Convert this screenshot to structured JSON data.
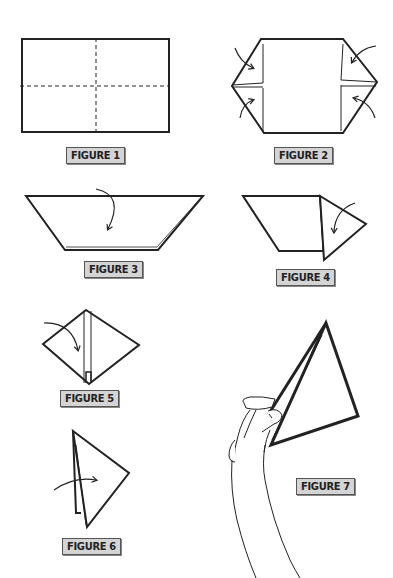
{
  "diagram": {
    "type": "origami-instructions",
    "colors": {
      "line": "#222222",
      "label_bg": "#d4d4d4",
      "label_border": "#555555"
    },
    "figures": [
      {
        "id": 1,
        "label": "FIGURE 1",
        "description": "rectangle with dashed vertical and horizontal center fold lines"
      },
      {
        "id": 2,
        "label": "FIGURE 2",
        "description": "four corners folded to center line, arrows indicating folds"
      },
      {
        "id": 3,
        "label": "FIGURE 3",
        "description": "trapezoid folded in half, curved arrow showing fold down"
      },
      {
        "id": 4,
        "label": "FIGURE 4",
        "description": "right point folded over, curved arrow"
      },
      {
        "id": 5,
        "label": "FIGURE 5",
        "description": "diamond shape, arrow folding left side over"
      },
      {
        "id": 6,
        "label": "FIGURE 6",
        "description": "triangle shape, arrow folding across"
      },
      {
        "id": 7,
        "label": "FIGURE 7",
        "description": "hand holding finished triangular glider"
      }
    ]
  }
}
